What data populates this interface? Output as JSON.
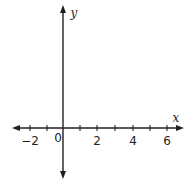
{
  "diagram": {
    "type": "coordinate-plane",
    "x_axis": {
      "label": "x",
      "tick_values": [
        -2,
        -1,
        0,
        1,
        2,
        3,
        4,
        5,
        6
      ],
      "labeled_ticks": [
        "-2",
        "0",
        "2",
        "4",
        "6"
      ],
      "tick_labels": {
        "neg2": "−2",
        "zero": "0",
        "two": "2",
        "four": "4",
        "six": "6"
      }
    },
    "y_axis": {
      "label": "y"
    },
    "colors": {
      "axis": "#231f20",
      "background": "#ffffff"
    }
  }
}
